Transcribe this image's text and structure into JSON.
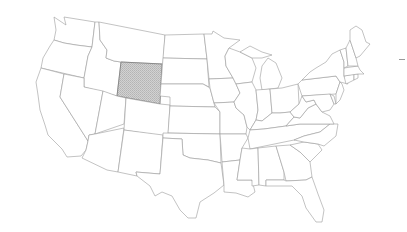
{
  "map": {
    "title": "United States",
    "highlighted_state": "Wyoming",
    "highlight_fill": "#c8c8c8",
    "stroke_color": "#9a9a9a",
    "background": "#ffffff"
  },
  "states": [
    {
      "name": "Washington",
      "id": "WA",
      "highlighted": false
    },
    {
      "name": "Oregon",
      "id": "OR",
      "highlighted": false
    },
    {
      "name": "California",
      "id": "CA",
      "highlighted": false
    },
    {
      "name": "Idaho",
      "id": "ID",
      "highlighted": false
    },
    {
      "name": "Nevada",
      "id": "NV",
      "highlighted": false
    },
    {
      "name": "Montana",
      "id": "MT",
      "highlighted": false
    },
    {
      "name": "Wyoming",
      "id": "WY",
      "highlighted": true
    },
    {
      "name": "Utah",
      "id": "UT",
      "highlighted": false
    },
    {
      "name": "Arizona",
      "id": "AZ",
      "highlighted": false
    },
    {
      "name": "Colorado",
      "id": "CO",
      "highlighted": false
    },
    {
      "name": "New Mexico",
      "id": "NM",
      "highlighted": false
    },
    {
      "name": "North Dakota",
      "id": "ND",
      "highlighted": false
    },
    {
      "name": "South Dakota",
      "id": "SD",
      "highlighted": false
    },
    {
      "name": "Nebraska",
      "id": "NE",
      "highlighted": false
    },
    {
      "name": "Kansas",
      "id": "KS",
      "highlighted": false
    },
    {
      "name": "Oklahoma",
      "id": "OK",
      "highlighted": false
    },
    {
      "name": "Texas",
      "id": "TX",
      "highlighted": false
    },
    {
      "name": "Minnesota",
      "id": "MN",
      "highlighted": false
    },
    {
      "name": "Iowa",
      "id": "IA",
      "highlighted": false
    },
    {
      "name": "Missouri",
      "id": "MO",
      "highlighted": false
    },
    {
      "name": "Arkansas",
      "id": "AR",
      "highlighted": false
    },
    {
      "name": "Louisiana",
      "id": "LA",
      "highlighted": false
    },
    {
      "name": "Wisconsin",
      "id": "WI",
      "highlighted": false
    },
    {
      "name": "Illinois",
      "id": "IL",
      "highlighted": false
    },
    {
      "name": "Michigan",
      "id": "MI",
      "highlighted": false
    },
    {
      "name": "Indiana",
      "id": "IN",
      "highlighted": false
    },
    {
      "name": "Ohio",
      "id": "OH",
      "highlighted": false
    },
    {
      "name": "Kentucky",
      "id": "KY",
      "highlighted": false
    },
    {
      "name": "Tennessee",
      "id": "TN",
      "highlighted": false
    },
    {
      "name": "Mississippi",
      "id": "MS",
      "highlighted": false
    },
    {
      "name": "Alabama",
      "id": "AL",
      "highlighted": false
    },
    {
      "name": "Georgia",
      "id": "GA",
      "highlighted": false
    },
    {
      "name": "Florida",
      "id": "FL",
      "highlighted": false
    },
    {
      "name": "South Carolina",
      "id": "SC",
      "highlighted": false
    },
    {
      "name": "North Carolina",
      "id": "NC",
      "highlighted": false
    },
    {
      "name": "Virginia",
      "id": "VA",
      "highlighted": false
    },
    {
      "name": "West Virginia",
      "id": "WV",
      "highlighted": false
    },
    {
      "name": "Pennsylvania",
      "id": "PA",
      "highlighted": false
    },
    {
      "name": "New York",
      "id": "NY",
      "highlighted": false
    },
    {
      "name": "Maryland",
      "id": "MD",
      "highlighted": false
    },
    {
      "name": "Delaware",
      "id": "DE",
      "highlighted": false
    },
    {
      "name": "New Jersey",
      "id": "NJ",
      "highlighted": false
    },
    {
      "name": "Connecticut",
      "id": "CT",
      "highlighted": false
    },
    {
      "name": "Rhode Island",
      "id": "RI",
      "highlighted": false
    },
    {
      "name": "Massachusetts",
      "id": "MA",
      "highlighted": false
    },
    {
      "name": "Vermont",
      "id": "VT",
      "highlighted": false
    },
    {
      "name": "New Hampshire",
      "id": "NH",
      "highlighted": false
    },
    {
      "name": "Maine",
      "id": "ME",
      "highlighted": false
    }
  ]
}
